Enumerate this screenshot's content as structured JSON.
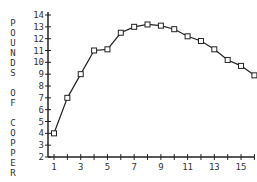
{
  "chart_data": {
    "type": "line",
    "title": "",
    "xlabel": "",
    "ylabel": "POUNDS OF COPPER",
    "x": [
      1,
      2,
      3,
      4,
      5,
      6,
      7,
      8,
      9,
      10,
      11,
      12,
      13,
      14,
      15,
      16
    ],
    "series": [
      {
        "name": "Pounds of copper",
        "values": [
          4,
          7,
          9,
          11,
          11.1,
          12.5,
          13,
          13.2,
          13.1,
          12.8,
          12.2,
          11.8,
          11.1,
          10.2,
          9.7,
          8.9
        ],
        "marker": "square"
      }
    ],
    "xlim": [
      0.5,
      17
    ],
    "ylim": [
      2,
      14
    ],
    "x_tick_labels": [
      "1",
      "3",
      "5",
      "7",
      "9",
      "11",
      "13",
      "15"
    ],
    "y_tick_labels": [
      "2",
      "3",
      "4",
      "5",
      "6",
      "7",
      "8",
      "9",
      "10",
      "11",
      "12",
      "13",
      "14"
    ],
    "grid": false,
    "legend": "none"
  },
  "colors": {
    "line": "#222222",
    "axis": "#222222",
    "text": "#333333"
  }
}
